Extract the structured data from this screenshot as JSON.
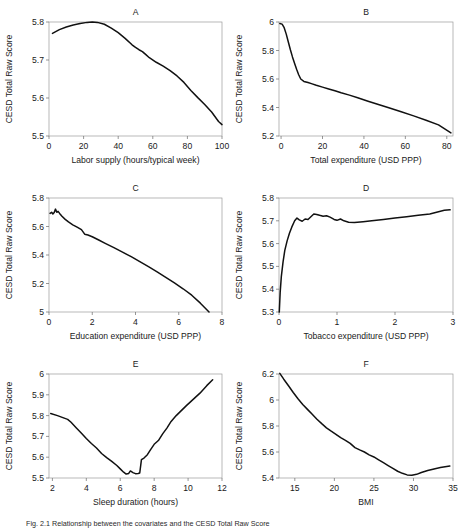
{
  "figure": {
    "caption": "Fig. 2.1  Relationship between the covariates and the CESD Total Raw Score",
    "ylabel_shared": "CESD Total Raw Score",
    "curve_color": "#111111",
    "frame_color": "#9a9a9a"
  },
  "chart_data": [
    {
      "type": "line",
      "title": "A",
      "xlabel": "Labor supply (hours/typical week)",
      "ylabel": "CESD Total Raw Score",
      "xlim": [
        0,
        100
      ],
      "ylim": [
        5.5,
        5.8
      ],
      "xticks": [
        0,
        20,
        40,
        60,
        80,
        100
      ],
      "xticklabels": [
        "0",
        "20",
        "40",
        "60",
        "80",
        "100"
      ],
      "yticks": [
        5.5,
        5.6,
        5.7,
        5.8
      ],
      "yticklabels": [
        "5.5",
        "5.6",
        "5.7",
        "5.8"
      ],
      "grid": false,
      "legend": "none",
      "x": [
        2,
        6,
        10,
        14,
        18,
        22,
        25,
        28,
        32,
        36,
        40,
        44,
        48,
        50,
        52,
        54,
        56,
        58,
        62,
        66,
        70,
        74,
        78,
        82,
        86,
        90,
        94,
        98,
        100
      ],
      "y": [
        5.77,
        5.78,
        5.787,
        5.792,
        5.796,
        5.799,
        5.8,
        5.799,
        5.794,
        5.784,
        5.772,
        5.757,
        5.74,
        5.733,
        5.727,
        5.722,
        5.714,
        5.706,
        5.694,
        5.684,
        5.672,
        5.658,
        5.641,
        5.62,
        5.601,
        5.583,
        5.563,
        5.538,
        5.53
      ]
    },
    {
      "type": "line",
      "title": "B",
      "xlabel": "Total expenditure (USD PPP)",
      "ylabel": "CESD Total Raw Score",
      "xlim": [
        -1,
        83
      ],
      "ylim": [
        5.2,
        6.0
      ],
      "xticks": [
        0,
        20,
        40,
        60,
        80
      ],
      "xticklabels": [
        "0",
        "20",
        "40",
        "60",
        "80"
      ],
      "yticks": [
        5.2,
        5.4,
        5.6,
        5.8,
        6.0
      ],
      "yticklabels": [
        "5.2",
        "5.4",
        "5.6",
        "5.8",
        "6"
      ],
      "grid": false,
      "legend": "none",
      "x": [
        -0.6,
        0.5,
        1.5,
        2.5,
        3.5,
        4.5,
        5.5,
        6.5,
        7.5,
        8.5,
        9.5,
        11,
        13,
        15,
        17,
        20,
        23,
        26,
        29,
        33,
        37,
        42,
        47,
        52,
        58,
        64,
        70,
        76,
        82
      ],
      "y": [
        5.99,
        5.985,
        5.96,
        5.915,
        5.86,
        5.805,
        5.755,
        5.71,
        5.668,
        5.63,
        5.6,
        5.583,
        5.575,
        5.566,
        5.556,
        5.543,
        5.53,
        5.518,
        5.503,
        5.487,
        5.468,
        5.444,
        5.421,
        5.398,
        5.37,
        5.341,
        5.311,
        5.278,
        5.222
      ]
    },
    {
      "type": "line",
      "title": "C",
      "xlabel": "Education expenditure (USD PPP)",
      "ylabel": "CESD Total Raw Score",
      "xlim": [
        0,
        8
      ],
      "ylim": [
        5.0,
        5.8
      ],
      "xticks": [
        0,
        2,
        4,
        6,
        8
      ],
      "xticklabels": [
        "0",
        "2",
        "4",
        "6",
        "8"
      ],
      "yticks": [
        5.0,
        5.2,
        5.4,
        5.6,
        5.8
      ],
      "yticklabels": [
        "5",
        "5.2",
        "5.4",
        "5.6",
        "5.8"
      ],
      "grid": false,
      "legend": "none",
      "x": [
        0.05,
        0.12,
        0.18,
        0.24,
        0.3,
        0.36,
        0.42,
        0.5,
        0.6,
        0.75,
        0.9,
        1.1,
        1.3,
        1.5,
        1.65,
        1.8,
        2.0,
        2.3,
        2.6,
        3.0,
        3.4,
        3.8,
        4.2,
        4.6,
        5.0,
        5.4,
        5.8,
        6.2,
        6.6,
        7.0,
        7.4
      ],
      "y": [
        5.692,
        5.7,
        5.688,
        5.698,
        5.722,
        5.7,
        5.706,
        5.69,
        5.672,
        5.65,
        5.632,
        5.612,
        5.596,
        5.578,
        5.546,
        5.54,
        5.528,
        5.505,
        5.482,
        5.452,
        5.42,
        5.388,
        5.353,
        5.318,
        5.282,
        5.243,
        5.204,
        5.163,
        5.118,
        5.062,
        5.0
      ]
    },
    {
      "type": "line",
      "title": "D",
      "xlabel": "Tobacco expenditure (USD PPP)",
      "ylabel": "CESD Total Raw Score",
      "xlim": [
        0,
        3
      ],
      "ylim": [
        5.3,
        5.8
      ],
      "xticks": [
        0,
        1,
        2,
        3
      ],
      "xticklabels": [
        "0",
        "1",
        "2",
        "3"
      ],
      "yticks": [
        5.3,
        5.4,
        5.5,
        5.6,
        5.7,
        5.8
      ],
      "yticklabels": [
        "5.3",
        "5.4",
        "5.5",
        "5.6",
        "5.7",
        "5.8"
      ],
      "grid": false,
      "legend": "none",
      "x": [
        0.005,
        0.02,
        0.04,
        0.07,
        0.1,
        0.14,
        0.18,
        0.22,
        0.27,
        0.31,
        0.35,
        0.4,
        0.45,
        0.5,
        0.55,
        0.6,
        0.65,
        0.7,
        0.76,
        0.82,
        0.88,
        0.95,
        1.0,
        1.06,
        1.12,
        1.2,
        1.3,
        1.45,
        1.6,
        1.8,
        2.0,
        2.2,
        2.4,
        2.6,
        2.75,
        2.85,
        2.95
      ],
      "y": [
        5.3,
        5.385,
        5.455,
        5.52,
        5.57,
        5.612,
        5.645,
        5.672,
        5.7,
        5.712,
        5.704,
        5.698,
        5.708,
        5.706,
        5.718,
        5.73,
        5.728,
        5.724,
        5.72,
        5.722,
        5.716,
        5.706,
        5.702,
        5.708,
        5.7,
        5.694,
        5.692,
        5.696,
        5.7,
        5.706,
        5.712,
        5.718,
        5.724,
        5.73,
        5.74,
        5.746,
        5.748
      ]
    },
    {
      "type": "line",
      "title": "E",
      "xlabel": "Sleep duration (hours)",
      "ylabel": "CESD Total Raw Score",
      "xlim": [
        1.8,
        12
      ],
      "ylim": [
        5.5,
        6.0
      ],
      "xticks": [
        2,
        4,
        6,
        8,
        10,
        12
      ],
      "xticklabels": [
        "2",
        "4",
        "6",
        "8",
        "10",
        "12"
      ],
      "yticks": [
        5.5,
        5.6,
        5.7,
        5.8,
        5.9,
        6.0
      ],
      "yticklabels": [
        "5.5",
        "5.6",
        "5.7",
        "5.8",
        "5.9",
        "6"
      ],
      "grid": false,
      "legend": "none",
      "x": [
        1.9,
        2.3,
        2.7,
        2.9,
        3.1,
        3.4,
        3.7,
        4.0,
        4.3,
        4.6,
        4.9,
        5.2,
        5.5,
        5.8,
        6.0,
        6.2,
        6.35,
        6.5,
        6.6,
        6.75,
        6.9,
        7.05,
        7.15,
        7.25,
        7.4,
        7.6,
        7.8,
        8.0,
        8.25,
        8.5,
        8.75,
        9.0,
        9.3,
        9.6,
        9.9,
        10.3,
        10.7,
        11.1,
        11.45
      ],
      "y": [
        5.81,
        5.8,
        5.788,
        5.782,
        5.768,
        5.742,
        5.716,
        5.69,
        5.666,
        5.644,
        5.618,
        5.598,
        5.58,
        5.56,
        5.544,
        5.528,
        5.519,
        5.522,
        5.534,
        5.526,
        5.521,
        5.522,
        5.524,
        5.588,
        5.596,
        5.612,
        5.638,
        5.662,
        5.68,
        5.712,
        5.74,
        5.772,
        5.8,
        5.824,
        5.848,
        5.878,
        5.908,
        5.944,
        5.972
      ]
    },
    {
      "type": "line",
      "title": "F",
      "xlabel": "BMI",
      "ylabel": "CESD Total Raw Score",
      "xlim": [
        13,
        35
      ],
      "ylim": [
        5.4,
        6.2
      ],
      "xticks": [
        15,
        20,
        25,
        30,
        35
      ],
      "xticklabels": [
        "15",
        "20",
        "25",
        "30",
        "35"
      ],
      "yticks": [
        5.4,
        5.6,
        5.8,
        6.0,
        6.2
      ],
      "yticklabels": [
        "5.4",
        "5.6",
        "5.8",
        "6",
        "6.2"
      ],
      "grid": false,
      "legend": "none",
      "x": [
        13.1,
        13.6,
        14.2,
        14.8,
        15.4,
        16.0,
        16.6,
        17.2,
        17.8,
        18.4,
        19.0,
        19.6,
        20.2,
        20.8,
        21.4,
        22.0,
        22.6,
        23.2,
        23.8,
        24.4,
        25.0,
        25.6,
        26.2,
        26.8,
        27.4,
        28.0,
        28.6,
        29.2,
        29.8,
        30.4,
        31.0,
        31.8,
        32.6,
        33.4,
        34.2,
        34.6
      ],
      "y": [
        6.205,
        6.16,
        6.11,
        6.058,
        6.01,
        5.966,
        5.928,
        5.89,
        5.852,
        5.818,
        5.786,
        5.76,
        5.736,
        5.71,
        5.69,
        5.666,
        5.634,
        5.616,
        5.6,
        5.578,
        5.562,
        5.54,
        5.518,
        5.496,
        5.474,
        5.452,
        5.436,
        5.424,
        5.422,
        5.428,
        5.442,
        5.458,
        5.47,
        5.48,
        5.488,
        5.492
      ]
    }
  ]
}
